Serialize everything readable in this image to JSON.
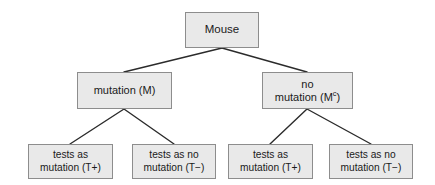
{
  "diagram": {
    "type": "probability-tree-diagram",
    "colors": {
      "background": "#ffffff",
      "node_fill": "#e9e9e9",
      "node_border": "#8d8d8d",
      "edge": "#2b2b2b",
      "text": "#1a1a1a"
    },
    "levels": [
      {
        "level": 0,
        "name": "population",
        "nodes": [
          {
            "id": "root",
            "label": "Mouse"
          }
        ]
      },
      {
        "level": 1,
        "name": "true-state",
        "nodes": [
          {
            "id": "mutation",
            "label": "mutation (M)",
            "symbol": "M"
          },
          {
            "id": "no-mutation",
            "label_line1": "no",
            "label_line2_prefix": "mutation (M",
            "label_superscript": "c",
            "label_line2_suffix": ")",
            "symbol": "Mᶜ"
          }
        ]
      },
      {
        "level": 2,
        "name": "test-result",
        "nodes": [
          {
            "id": "leaf-1",
            "label": "tests as\nmutation (T+)",
            "parent": "mutation",
            "symbol": "T+"
          },
          {
            "id": "leaf-2",
            "label": "tests as no\nmutation (T−)",
            "parent": "mutation",
            "symbol": "T−"
          },
          {
            "id": "leaf-3",
            "label": "tests as\nmutation (T+)",
            "parent": "no-mutation",
            "symbol": "T+"
          },
          {
            "id": "leaf-4",
            "label": "tests as no\nmutation (T−)",
            "parent": "no-mutation",
            "symbol": "T−"
          }
        ]
      }
    ],
    "edges": [
      {
        "from": "root",
        "to": "mutation"
      },
      {
        "from": "root",
        "to": "no-mutation"
      },
      {
        "from": "mutation",
        "to": "leaf-1"
      },
      {
        "from": "mutation",
        "to": "leaf-2"
      },
      {
        "from": "no-mutation",
        "to": "leaf-3"
      },
      {
        "from": "no-mutation",
        "to": "leaf-4"
      }
    ]
  }
}
